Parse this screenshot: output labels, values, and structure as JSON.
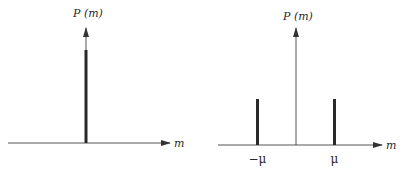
{
  "panels": [
    {
      "id": "single",
      "y_label": "P (m)",
      "x_label": "m",
      "spikes": [
        {
          "position": 0,
          "height": 1.0,
          "label": ""
        }
      ]
    },
    {
      "id": "double",
      "y_label": "P (m)",
      "x_label": "m",
      "spikes": [
        {
          "position": -1,
          "height": 0.5,
          "label": "−μ"
        },
        {
          "position": 1,
          "height": 0.5,
          "label": "μ"
        }
      ]
    }
  ],
  "colors": {
    "axis": "#555555",
    "spike": "#2a2a2a"
  }
}
